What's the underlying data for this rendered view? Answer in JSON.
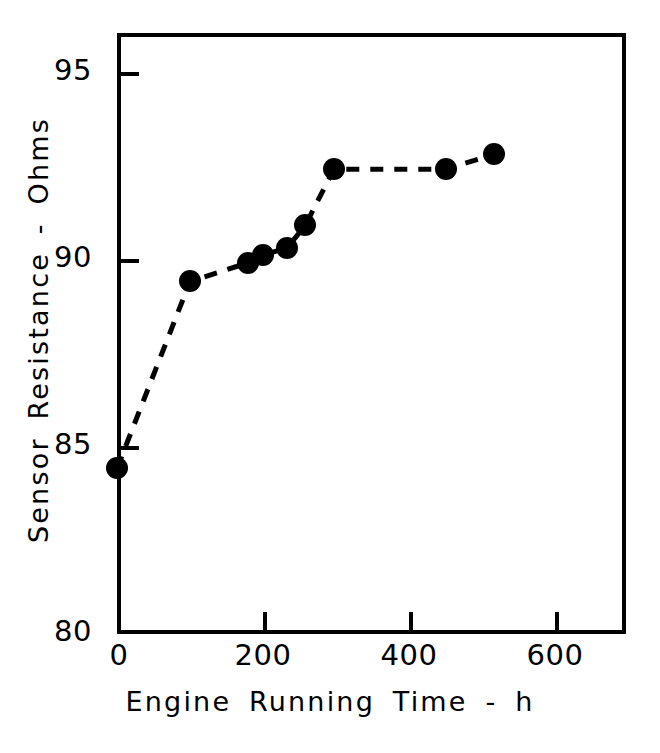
{
  "chart_data": {
    "type": "line",
    "title": "",
    "subtitle": "",
    "xlabel": "Engine  Running  Time - h",
    "ylabel": "Sensor  Resistance - Ohms",
    "xlim": [
      0,
      700
    ],
    "ylim": [
      80,
      96
    ],
    "xticks": [
      0,
      200,
      400,
      600
    ],
    "xtick_labels": [
      "0",
      "200",
      "400",
      "600"
    ],
    "yticks": [
      80,
      85,
      90,
      95
    ],
    "ytick_labels": [
      "80",
      "85",
      "90",
      "95"
    ],
    "grid": false,
    "legend": null,
    "line_style": "dashed",
    "marker_style": "filled-circle",
    "series": [
      {
        "name": "Sensor Resistance",
        "color": "#000000",
        "x": [
          0,
          100,
          180,
          200,
          233,
          258,
          297,
          450,
          517
        ],
        "y": [
          84.4,
          89.4,
          89.9,
          90.1,
          90.3,
          90.9,
          92.4,
          92.4,
          92.8
        ]
      }
    ],
    "annotations": []
  },
  "axes": {
    "x_axis_name": "x-axis",
    "y_axis_name": "y-axis"
  },
  "colors": {
    "foreground": "#000000",
    "background": "#ffffff"
  }
}
